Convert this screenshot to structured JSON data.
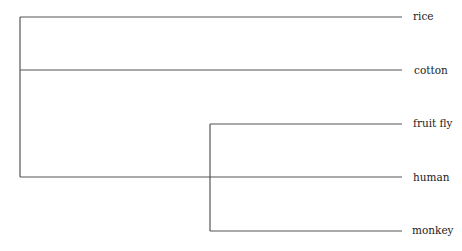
{
  "diagram": {
    "type": "phylogenetic-tree",
    "line_color": "#555555",
    "leaves": [
      {
        "id": "rice",
        "label": "rice",
        "y": 17
      },
      {
        "id": "cotton",
        "label": "cotton",
        "y": 70
      },
      {
        "id": "fruit-fly",
        "label": "fruit fly",
        "y": 124
      },
      {
        "id": "human",
        "label": "human",
        "y": 177
      },
      {
        "id": "monkey",
        "label": "monkey",
        "y": 231
      }
    ],
    "clades": [
      {
        "id": "root",
        "x": 20,
        "y_top": 17,
        "y_bottom": 177,
        "children": [
          "rice",
          "cotton",
          "human"
        ]
      },
      {
        "id": "inner",
        "x": 210,
        "y_top": 124,
        "y_bottom": 231,
        "children": [
          "fruit-fly",
          "monkey"
        ]
      }
    ]
  }
}
